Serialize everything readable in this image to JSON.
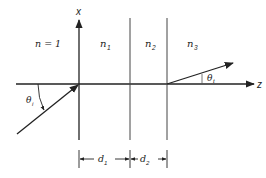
{
  "diagram": {
    "type": "multilayer-refraction",
    "axes": {
      "x_label": "x",
      "z_label": "z"
    },
    "regions": [
      {
        "label": "n = 1"
      },
      {
        "label": "n",
        "sub": "1"
      },
      {
        "label": "n",
        "sub": "2"
      },
      {
        "label": "n",
        "sub": "3"
      }
    ],
    "angles": {
      "incident": {
        "symbol": "θ",
        "sub": "i"
      },
      "transmitted": {
        "symbol": "θ",
        "sub": "t"
      }
    },
    "dimensions": [
      {
        "symbol": "d",
        "sub": "1"
      },
      {
        "symbol": "d",
        "sub": "2"
      }
    ],
    "colors": {
      "line": "#222222",
      "background": "#ffffff"
    }
  }
}
